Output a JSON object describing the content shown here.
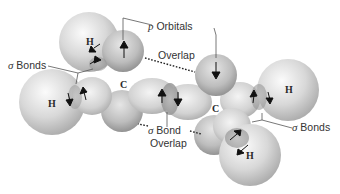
{
  "diagram": {
    "labels": {
      "p_orbitals": {
        "prefix": "p",
        "text": " Orbitals"
      },
      "overlap_top": "Overlap",
      "sigma_bonds_left": {
        "prefix": "σ",
        "text": " Bonds"
      },
      "sigma_bonds_right": {
        "prefix": "σ",
        "text": " Bonds"
      },
      "sigma_bond_overlap": {
        "prefix": "σ",
        "line1": " Bond",
        "line2": "Overlap"
      }
    },
    "atoms": [
      {
        "id": "h-top-left",
        "symbol": "H"
      },
      {
        "id": "h-left",
        "symbol": "H"
      },
      {
        "id": "c-left",
        "symbol": "C"
      },
      {
        "id": "c-right",
        "symbol": "C"
      },
      {
        "id": "h-right",
        "symbol": "H"
      },
      {
        "id": "h-bottom-right",
        "symbol": "H"
      }
    ],
    "colors": {
      "sphere_light": "#f2f2f2",
      "sphere_mid": "#c8c8c8",
      "sphere_dark": "#9a9a9a",
      "p_orbital_light": "#e0e0e0",
      "p_orbital_dark": "#8c8c8c",
      "leader_line": "#555555",
      "arrow": "#111111"
    }
  }
}
